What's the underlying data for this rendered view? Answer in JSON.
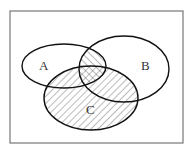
{
  "diagram": {
    "type": "venn",
    "universe_frame": true,
    "sets": [
      {
        "id": "A",
        "label": "A"
      },
      {
        "id": "B",
        "label": "B"
      },
      {
        "id": "C",
        "label": "C"
      }
    ],
    "shaded_regions": [
      {
        "region": "C",
        "pattern": "diagonal-hatch"
      },
      {
        "region": "A∩B",
        "pattern": "diagonal-hatch-reverse"
      },
      {
        "region": "A∩B∩C",
        "pattern": "crosshatch"
      }
    ],
    "colors": {
      "outline": "#111111",
      "hatch": "#555555",
      "frame": "#777777",
      "background": "#ffffff"
    }
  }
}
